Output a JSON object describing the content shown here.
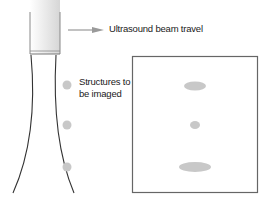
{
  "labels": {
    "beam_travel": "Ultrasound beam travel",
    "structures_line1": "Structures to",
    "structures_line2": "be imaged"
  },
  "colors": {
    "outline": "#333333",
    "box_border": "#666666",
    "arrow": "#9a9a9a",
    "structure_fill": "#c8c8c8",
    "transducer_gradient_start": "#ffffff",
    "transducer_gradient_end": "#d6d6d6"
  },
  "structures_beam": [
    {
      "cx": 67,
      "cy": 85,
      "r": 4.5
    },
    {
      "cx": 67,
      "cy": 125,
      "r": 4.5
    },
    {
      "cx": 67,
      "cy": 167,
      "r": 4.5
    }
  ],
  "structures_image": [
    {
      "cx": 195,
      "cy": 86,
      "rx": 11,
      "ry": 4.5
    },
    {
      "cx": 195,
      "cy": 125,
      "rx": 5,
      "ry": 4
    },
    {
      "cx": 195,
      "cy": 167,
      "rx": 16,
      "ry": 5
    }
  ]
}
